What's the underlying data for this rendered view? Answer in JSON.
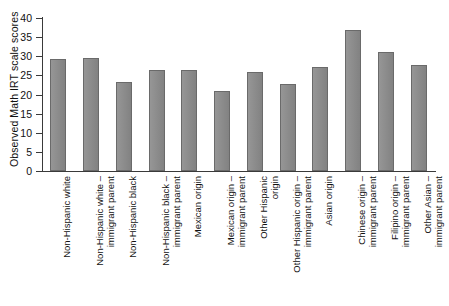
{
  "chart_data": {
    "type": "bar",
    "title": "",
    "xlabel": "",
    "ylabel": "Observed Math IRT scale scores",
    "ylim": [
      0,
      40
    ],
    "yticks": [
      "0",
      "5",
      "10",
      "15",
      "20",
      "25",
      "30",
      "35",
      "40"
    ],
    "grid": false,
    "legend": "none",
    "bar_color": "#8a8a8a",
    "bar_edge_color": "#6a6a6a",
    "categories": [
      "Non-Hispanic white",
      "Non-Hispanic white – immigrant parent",
      "Non-Hispanic black",
      "Non-Hispanic black – immigrant parent",
      "Mexican origin",
      "Mexican origin – immigrant parent",
      "Other Hispanic origin",
      "Other Hispanic origin – immigrant parent",
      "Asian origin",
      "Chinese origin – immigrant parent",
      "Filipino origin – immigrant parent",
      "Other Asian – immigrant parent"
    ],
    "category_lines": [
      [
        "Non-Hispanic white",
        ""
      ],
      [
        "Non-Hispanic white –",
        "immigrant parent"
      ],
      [
        "Non-Hispanic black",
        ""
      ],
      [
        "Non-Hispanic black –",
        "immigrant parent"
      ],
      [
        "Mexican origin",
        ""
      ],
      [
        "Mexican origin –",
        "immigrant parent"
      ],
      [
        "Other Hispanic",
        "origin"
      ],
      [
        "Other Hispanic origin –",
        "immigrant parent"
      ],
      [
        "Asian origin",
        ""
      ],
      [
        "Chinese origin –",
        "immigrant parent"
      ],
      [
        "Filipino origin –",
        "immigrant parent"
      ],
      [
        "Other Asian –",
        "immigrant parent"
      ]
    ],
    "values": [
      29.2,
      29.5,
      23.2,
      26.4,
      26.5,
      21.0,
      25.8,
      22.8,
      27.3,
      36.9,
      31.2,
      27.7
    ]
  },
  "caption": {
    "partial_text": ""
  }
}
